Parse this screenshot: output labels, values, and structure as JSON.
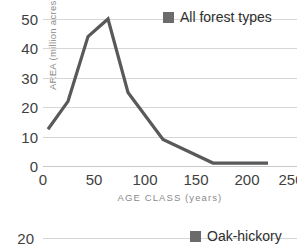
{
  "chart_data": [
    {
      "type": "line",
      "title": "",
      "xlabel": "AGE CLASS (years)",
      "ylabel": "AREA (million acres)",
      "xlim": [
        0,
        254
      ],
      "ylim": [
        0,
        50
      ],
      "grid": true,
      "legend_position": "top-right",
      "x_ticks": [
        {
          "value": 0,
          "label": "0"
        },
        {
          "value": 50,
          "label": "50"
        },
        {
          "value": 100,
          "label": "100"
        },
        {
          "value": 150,
          "label": "150"
        },
        {
          "value": 200,
          "label": "200"
        },
        {
          "value": 250,
          "label": "250"
        }
      ],
      "y_ticks": [
        {
          "value": 0,
          "label": "0"
        },
        {
          "value": 10,
          "label": "10"
        },
        {
          "value": 20,
          "label": "20"
        },
        {
          "value": 30,
          "label": "30"
        },
        {
          "value": 40,
          "label": "40"
        },
        {
          "value": 50,
          "label": "50"
        }
      ],
      "series": [
        {
          "name": "All forest types",
          "color": "#595959",
          "x": [
            5,
            25,
            45,
            55,
            65,
            85,
            120,
            145,
            170,
            200,
            225
          ],
          "values": [
            12.5,
            22,
            44,
            47,
            50,
            25,
            9,
            5,
            1,
            1,
            1
          ]
        }
      ]
    },
    {
      "type": "line",
      "title": "",
      "xlabel": "",
      "ylabel": "",
      "ylim": [
        0,
        20
      ],
      "grid": true,
      "legend_position": "top-right",
      "y_ticks": [
        {
          "value": 20,
          "label": "20"
        }
      ],
      "series": [
        {
          "name": "Oak-hickory",
          "color": "#6b6b6b",
          "x": [],
          "values": []
        }
      ]
    }
  ],
  "top_chart": {
    "y_axis_title": "AREA (million acres)",
    "x_axis_title": "AGE CLASS (years)",
    "y_tick_labels": [
      "50",
      "40",
      "30",
      "20",
      "10",
      "0"
    ],
    "x_tick_labels": [
      "0",
      "50",
      "100",
      "150",
      "200",
      "250"
    ],
    "legend": {
      "label": "All forest types",
      "color": "#6b6b6b"
    }
  },
  "bottom_chart": {
    "y_tick_label": "20",
    "legend": {
      "label": "Oak-hickory",
      "color": "#6b6b6b"
    }
  }
}
